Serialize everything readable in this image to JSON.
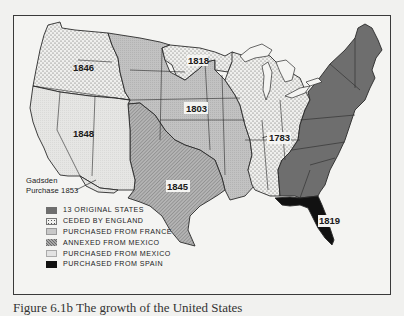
{
  "map": {
    "regions": [
      {
        "id": "original-13",
        "label": "1783 original",
        "fill": "#6e6e6e"
      },
      {
        "id": "ceded-england",
        "year": "1783",
        "fill": "#eeeeee",
        "pattern": "dots"
      },
      {
        "id": "louisiana-purchase",
        "year": "1803",
        "fill": "#bcbcbc"
      },
      {
        "id": "red-river-cession",
        "year": "1818",
        "fill": "#eeeeee",
        "pattern": "dots"
      },
      {
        "id": "florida",
        "year": "1819",
        "fill": "#111111"
      },
      {
        "id": "texas-annexation",
        "year": "1845",
        "fill": "#a8a8a8",
        "pattern": "hatch"
      },
      {
        "id": "oregon-country",
        "year": "1846",
        "fill": "#eeeeee",
        "pattern": "dots"
      },
      {
        "id": "mexican-cession",
        "year": "1848",
        "fill": "#e2e2e2"
      },
      {
        "id": "gadsden-purchase",
        "year": "1853",
        "fill": "#e2e2e2"
      }
    ],
    "year_labels": {
      "y1846": "1846",
      "y1818": "1818",
      "y1803": "1803",
      "y1848": "1848",
      "y1783": "1783",
      "y1845": "1845",
      "y1819": "1819"
    },
    "gadsden_label_line1": "Gadsden",
    "gadsden_label_line2": "Purchase 1853"
  },
  "legend": {
    "items": [
      {
        "label": "13 ORIGINAL STATES",
        "swatch": "solid-dark-gray",
        "color": "#6e6e6e"
      },
      {
        "label": "CEDED BY ENGLAND",
        "swatch": "dotted",
        "color": "#eeeeee"
      },
      {
        "label": "PURCHASED FROM FRANCE",
        "swatch": "light-gray",
        "color": "#bcbcbc"
      },
      {
        "label": "ANNEXED FROM MEXICO",
        "swatch": "hatched",
        "color": "#a8a8a8"
      },
      {
        "label": "PURCHASED FROM MEXICO",
        "swatch": "very-light-gray",
        "color": "#e2e2e2"
      },
      {
        "label": "PURCHASED FROM SPAIN",
        "swatch": "black",
        "color": "#111111"
      }
    ]
  },
  "caption": {
    "text": "Figure 6.1b  The growth of the United States"
  }
}
